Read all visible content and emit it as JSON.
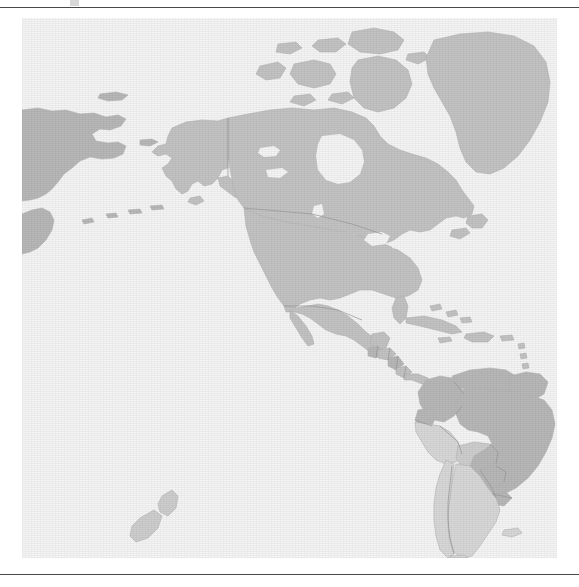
{
  "figure": {
    "kind": "map",
    "title": "",
    "caption": "",
    "projection": "equirectangular",
    "centered_on": "Americas",
    "background_color": "#ffffff",
    "rules": {
      "top_rule_color": "#4a4a4a",
      "bottom_rule_color": "#4a4a4a"
    }
  },
  "map": {
    "ocean_color": "#f6f6f6",
    "land_stroke_color": "#b6b6b6",
    "internal_border_color": "#9a9a9a",
    "palette": {
      "lightest": "#d9d9d9",
      "light": "#cfcfcf",
      "medium": "#c4c4c4",
      "dark": "#b9b9b9"
    },
    "legend_visible": false,
    "labels_visible": false,
    "graticule_visible": false,
    "extent": {
      "west_longitude": -195,
      "east_longitude": -20,
      "north_latitude": 84,
      "south_latitude": -58
    },
    "regions": [
      {
        "name": "Russia (Chukotka / Kamchatka)",
        "tone": "dark"
      },
      {
        "name": "Alaska (United States)",
        "tone": "medium"
      },
      {
        "name": "Canada",
        "tone": "medium"
      },
      {
        "name": "Greenland",
        "tone": "medium"
      },
      {
        "name": "United States",
        "tone": "medium"
      },
      {
        "name": "Mexico",
        "tone": "medium"
      },
      {
        "name": "Guatemala",
        "tone": "dark"
      },
      {
        "name": "Honduras",
        "tone": "medium"
      },
      {
        "name": "Nicaragua",
        "tone": "dark"
      },
      {
        "name": "Costa Rica",
        "tone": "medium"
      },
      {
        "name": "Panama",
        "tone": "medium"
      },
      {
        "name": "Cuba",
        "tone": "medium"
      },
      {
        "name": "Hispaniola",
        "tone": "medium"
      },
      {
        "name": "Colombia",
        "tone": "dark"
      },
      {
        "name": "Venezuela",
        "tone": "dark"
      },
      {
        "name": "Guyana / Suriname",
        "tone": "dark"
      },
      {
        "name": "Ecuador",
        "tone": "dark"
      },
      {
        "name": "Peru",
        "tone": "lightest"
      },
      {
        "name": "Bolivia",
        "tone": "light"
      },
      {
        "name": "Brazil",
        "tone": "dark"
      },
      {
        "name": "Paraguay",
        "tone": "dark"
      },
      {
        "name": "Uruguay",
        "tone": "dark"
      },
      {
        "name": "Argentina",
        "tone": "lightest"
      },
      {
        "name": "Chile",
        "tone": "lightest"
      },
      {
        "name": "Falkland Islands",
        "tone": "lightest"
      },
      {
        "name": "New Zealand",
        "tone": "light"
      }
    ]
  }
}
